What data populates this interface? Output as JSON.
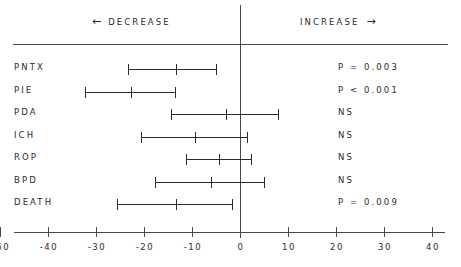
{
  "header": {
    "decrease": {
      "text": "DECREASE",
      "arrow": "←",
      "arrow_name": "left-arrow-icon"
    },
    "increase": {
      "text": "INCREASE",
      "arrow": "→",
      "arrow_name": "right-arrow-icon"
    }
  },
  "axis": {
    "ticks": [
      -50,
      -40,
      -30,
      -20,
      -10,
      0,
      10,
      20,
      30,
      40,
      50
    ],
    "tick_labels": [
      "-50",
      "-40",
      "-30",
      "-20",
      "-10",
      "0",
      "10",
      "20",
      "30",
      "40",
      "50"
    ]
  },
  "chart_data": {
    "type": "scatter",
    "title": "",
    "subtitle": "",
    "xlabel": "",
    "ylabel": "",
    "xlim": [
      -55,
      55
    ],
    "grid": false,
    "legend": false,
    "reference_line": 0,
    "orientation": "horizontal",
    "categories": [
      "PNTX",
      "PIE",
      "PDA",
      "ICH",
      "ROP",
      "BPD",
      "DEATH"
    ],
    "annotations": [
      "P = 0.003",
      "P < 0.001",
      "NS",
      "NS",
      "NS",
      "NS",
      "P = 0.009"
    ],
    "points": [
      {
        "label": "PNTX",
        "estimate": -13.3,
        "low": -23.3,
        "high": -5.0,
        "pvalue": "P = 0.003",
        "significant": true
      },
      {
        "label": "PIE",
        "estimate": -22.7,
        "low": -32.3,
        "high": -13.5,
        "pvalue": "P < 0.001",
        "significant": true
      },
      {
        "label": "PDA",
        "estimate": -2.9,
        "low": -14.4,
        "high": 7.9,
        "pvalue": "NS",
        "significant": false
      },
      {
        "label": "ICH",
        "estimate": -9.4,
        "low": -20.6,
        "high": 1.5,
        "pvalue": "NS",
        "significant": false
      },
      {
        "label": "ROP",
        "estimate": -4.4,
        "low": -11.3,
        "high": 2.3,
        "pvalue": "NS",
        "significant": false
      },
      {
        "label": "BPD",
        "estimate": -6.0,
        "low": -17.7,
        "high": 5.0,
        "pvalue": "NS",
        "significant": false
      },
      {
        "label": "DEATH",
        "estimate": -13.3,
        "low": -25.6,
        "high": -1.7,
        "pvalue": "P = 0.009",
        "significant": true
      }
    ]
  },
  "colors": {
    "ink": "#2b2b2b",
    "rule": "#4a4a4a",
    "background": "#ffffff"
  }
}
